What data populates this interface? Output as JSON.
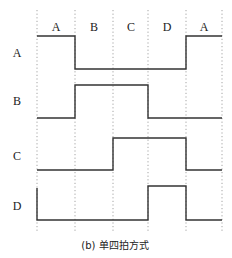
{
  "diagram": {
    "phase_labels": [
      "A",
      "B",
      "C",
      "D",
      "A"
    ],
    "signals": [
      {
        "name": "A",
        "levels": [
          1,
          0,
          0,
          0,
          1
        ]
      },
      {
        "name": "B",
        "levels": [
          0,
          1,
          1,
          0,
          0
        ]
      },
      {
        "name": "C",
        "levels": [
          0,
          0,
          1,
          1,
          0
        ]
      },
      {
        "name": "D",
        "levels": [
          0,
          0,
          0,
          1,
          0
        ]
      }
    ],
    "caption": "(b) 单四拍方式"
  }
}
